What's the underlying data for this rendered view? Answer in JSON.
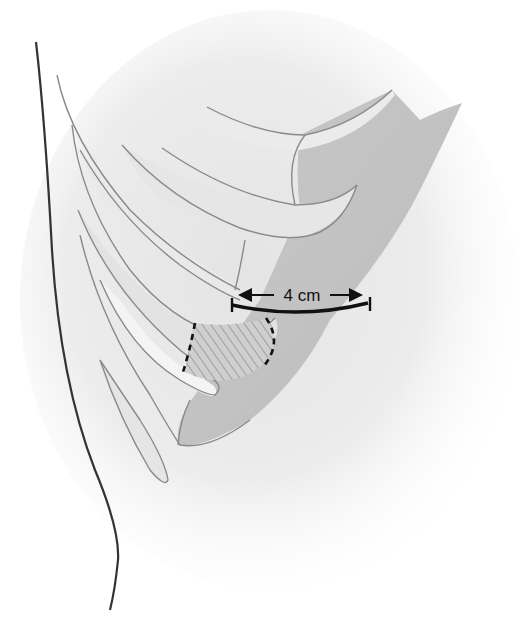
{
  "figure": {
    "measurement": {
      "label": "4 cm",
      "arrow_left": "←",
      "arrow_right": "→"
    },
    "hatched_region": {
      "description": "hatched area outlined with dashed border on rib"
    }
  },
  "colors": {
    "background": "#ffffff",
    "shadow": "#e6e6e6",
    "rib_light": "#e8e8e8",
    "rib_mid": "#d2d2d2",
    "cartilage_dark": "#bdbdbd",
    "outline": "#8a8a8a",
    "body_contour": "#333333",
    "annotation": "#111111",
    "hatch": "#8a8a8a"
  }
}
